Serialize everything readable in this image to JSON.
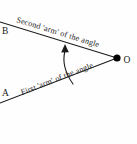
{
  "figure": {
    "background_color": "#fefefe",
    "stroke_color": "#1a1a1a",
    "labels": {
      "vertex": "O",
      "upper_endpoint": "B",
      "lower_endpoint": "A"
    },
    "captions": {
      "upper_arm": "Second 'arm' of the angle",
      "lower_arm": "First 'arm' of the angle"
    },
    "geometry": {
      "vertex_point": [
        117,
        58
      ],
      "upper_arm_end": [
        0,
        22
      ],
      "lower_arm_end": [
        0,
        103
      ],
      "arc_start": [
        73,
        83
      ],
      "arc_end": [
        65,
        48
      ],
      "arrow_direction": "counter-clockwise from first arm to second arm"
    }
  }
}
